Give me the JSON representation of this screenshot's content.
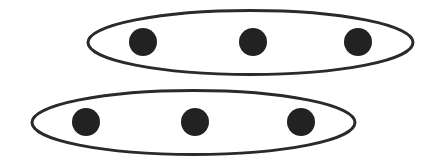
{
  "diagram": {
    "type": "grouped-dots",
    "colors": {
      "background": "#ffffff",
      "outline": "#2a2a2a",
      "dot": "#222222"
    },
    "groups": [
      {
        "name": "top-group",
        "ellipse": {
          "cx": 250.5,
          "cy": 42.5,
          "rx": 162.5,
          "ry": 32
        },
        "dots": [
          {
            "cx": 143,
            "cy": 42,
            "r": 14
          },
          {
            "cx": 253,
            "cy": 42,
            "r": 14
          },
          {
            "cx": 358,
            "cy": 42,
            "r": 14
          }
        ]
      },
      {
        "name": "bottom-group",
        "ellipse": {
          "cx": 193.5,
          "cy": 122.5,
          "rx": 161.5,
          "ry": 32
        },
        "dots": [
          {
            "cx": 86,
            "cy": 122,
            "r": 14
          },
          {
            "cx": 195,
            "cy": 122,
            "r": 14
          },
          {
            "cx": 301,
            "cy": 122,
            "r": 14
          }
        ]
      }
    ]
  }
}
